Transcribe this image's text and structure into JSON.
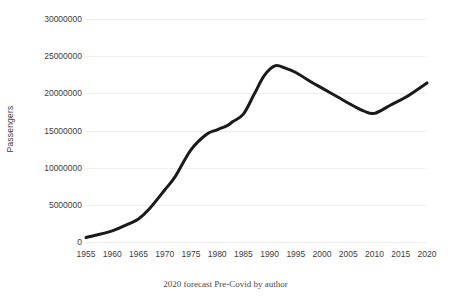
{
  "chart_data": {
    "type": "line",
    "title": "",
    "subtitle": "",
    "xlabel": "",
    "ylabel": "Passengers",
    "caption": "2020 forecast Pre-Covid by author",
    "grid": "horizontal-only",
    "legend": "none",
    "line_color": "#1a1a1a",
    "line_width_px": 3,
    "xlim": [
      1955,
      2020
    ],
    "ylim": [
      0,
      30000000
    ],
    "x_ticks": [
      1955,
      1960,
      1965,
      1970,
      1975,
      1980,
      1985,
      1990,
      1995,
      2000,
      2005,
      2010,
      2015,
      2020
    ],
    "x_tick_labels": [
      "1955",
      "1960",
      "1965",
      "1970",
      "1975",
      "1980",
      "1985",
      "1990",
      "1995",
      "2000",
      "2005",
      "2010",
      "2015",
      "2020"
    ],
    "y_ticks": [
      0,
      5000000,
      10000000,
      15000000,
      20000000,
      25000000,
      30000000
    ],
    "y_tick_labels": [
      "0",
      "5000000",
      "10000000",
      "15000000",
      "20000000",
      "25000000",
      "30000000"
    ],
    "series": [
      {
        "name": "Passengers",
        "x": [
          1955,
          1960,
          1963,
          1965,
          1967,
          1970,
          1972,
          1975,
          1978,
          1980,
          1982,
          1983,
          1985,
          1987,
          1989,
          1991,
          1993,
          1995,
          1998,
          2000,
          2003,
          2006,
          2008,
          2010,
          2013,
          2016,
          2020
        ],
        "values": [
          600000,
          1500000,
          2400000,
          3100000,
          4400000,
          7000000,
          8800000,
          12400000,
          14500000,
          15100000,
          15700000,
          16200000,
          17200000,
          19800000,
          22400000,
          23700000,
          23400000,
          22800000,
          21500000,
          20700000,
          19500000,
          18300000,
          17600000,
          17300000,
          18400000,
          19500000,
          21400000
        ]
      }
    ]
  }
}
